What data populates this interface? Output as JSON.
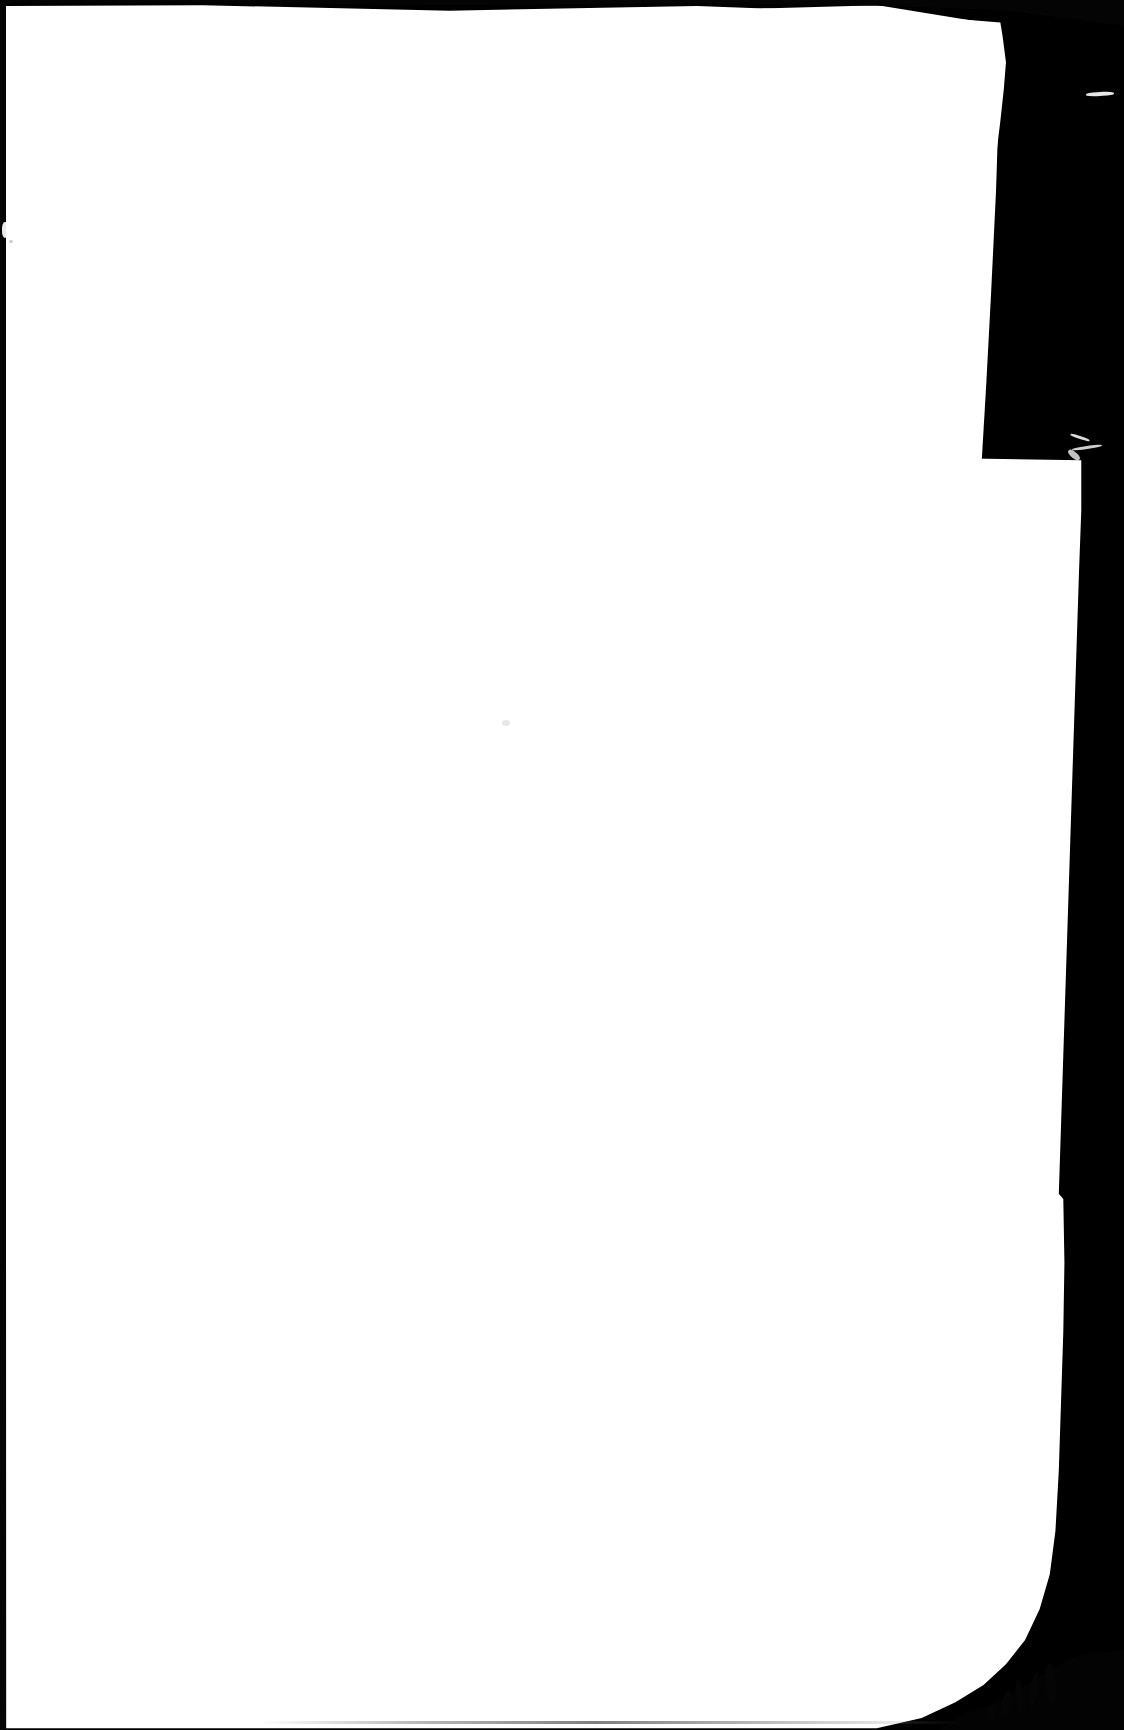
{
  "document": {
    "kind": "scanned-page",
    "page_state": "blank",
    "printed_text": "",
    "folio_number": "",
    "caption": "",
    "notes": ""
  },
  "canvas": {
    "width_px": 1124,
    "height_px": 1730,
    "background_color": "#000000"
  },
  "paper": {
    "color": "#ffffff",
    "left_edge_x_px": 6,
    "top_edge_y_px": 6,
    "right_edge_top_x_px": 1000,
    "right_edge_bottom_x_px": 1065,
    "bottom_edge_y_px": 1723
  },
  "scanner_background": {
    "color": "#000000",
    "left_gutter_color": "#050505",
    "top_band_color": "#040404",
    "top_band_height_px": 26,
    "left_gutter_width_px": 6
  },
  "artifacts": {
    "left_edge_nick": {
      "x_px": 2,
      "y_px": 222,
      "width_px": 6,
      "height_px": 16
    },
    "left_edge_speck": {
      "x_px": 9,
      "y_px": 240,
      "color": "#b9b9b9"
    },
    "page_dust_speck": {
      "x_px": 502,
      "y_px": 720,
      "color": "#afafb6"
    },
    "right_edge_fibre_top": {
      "x_px": 1086,
      "y_px": 92,
      "length_px": 28,
      "color": "#f2f2f2"
    },
    "right_edge_fibre_mid": {
      "x_px": 1067,
      "y_px": 436,
      "length_px": 30,
      "color": "#f2f2f2"
    },
    "torn_corner": {
      "corner": "bottom-right",
      "x_px": 940,
      "y_px": 1650
    },
    "bottom_edge_shadow": {
      "x_px": 260,
      "y_px": 1721,
      "width_px": 700,
      "color": "#5f5f5f"
    }
  }
}
